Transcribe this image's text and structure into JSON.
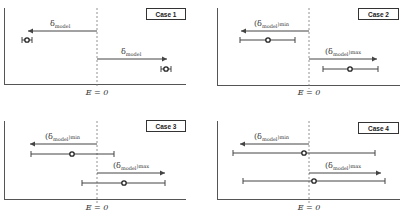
{
  "panels": [
    {
      "case_label": "Case 1",
      "axis_label": "E = 0",
      "arrow_left_label": "δ",
      "arrow_left_sub": "model",
      "arrow_left_suffix": "",
      "arrow_right_label": "δ",
      "arrow_right_sub": "model",
      "arrow_right_suffix": ""
    },
    {
      "case_label": "Case 2",
      "axis_label": "E = 0",
      "arrow_left_label": "(δ",
      "arrow_left_sub": "model",
      "arrow_left_suffix": ")min",
      "arrow_right_label": "(δ",
      "arrow_right_sub": "model",
      "arrow_right_suffix": ")max"
    },
    {
      "case_label": "Case 3",
      "axis_label": "E = 0",
      "arrow_left_label": "(δ",
      "arrow_left_sub": "model",
      "arrow_left_suffix": ")min",
      "arrow_right_label": "(δ",
      "arrow_right_sub": "model",
      "arrow_right_suffix": ")max"
    },
    {
      "case_label": "Case 4",
      "axis_label": "E = 0",
      "arrow_left_label": "(δ",
      "arrow_left_sub": "model",
      "arrow_left_suffix": ")min",
      "arrow_right_label": "(δ",
      "arrow_right_sub": "model",
      "arrow_right_suffix": ")max"
    }
  ],
  "colors": {
    "axis": "#555555",
    "line": "#444444",
    "background": "#ffffff"
  }
}
